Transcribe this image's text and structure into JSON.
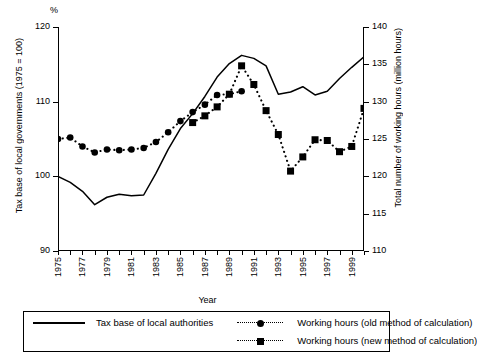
{
  "chart_data": {
    "type": "line",
    "title": "",
    "xlabel": "Year",
    "unit_mark": "%",
    "grid": false,
    "legend_position": "bottom",
    "x": [
      1975,
      1976,
      1977,
      1978,
      1979,
      1980,
      1981,
      1982,
      1983,
      1984,
      1985,
      1986,
      1987,
      1988,
      1989,
      1990,
      1991,
      1992,
      1993,
      1994,
      1995,
      1996,
      1997,
      1998,
      1999,
      2000
    ],
    "xlim": [
      1975,
      2000
    ],
    "xticks": [
      1975,
      1977,
      1979,
      1981,
      1983,
      1985,
      1987,
      1989,
      1991,
      1993,
      1995,
      1997,
      1999
    ],
    "xticklabels": [
      "1975",
      "1977",
      "1979",
      "1981",
      "1983",
      "1985",
      "1987",
      "1989",
      "1991",
      "1993",
      "1995",
      "1997",
      "1999"
    ],
    "axes": [
      {
        "side": "left",
        "label": "Tax base of local governments (1975 = 100)",
        "lim": [
          90,
          120
        ],
        "ticks": [
          90,
          100,
          110,
          120
        ],
        "ticklabels": [
          "90",
          "100",
          "110",
          "120"
        ]
      },
      {
        "side": "right",
        "label": "Total number of working hours (million hours)",
        "lim": [
          110,
          140
        ],
        "ticks": [
          110,
          115,
          120,
          125,
          130,
          135,
          140
        ],
        "ticklabels": [
          "110",
          "115",
          "120",
          "125",
          "130",
          "135",
          "140"
        ]
      }
    ],
    "series": [
      {
        "name": "Tax base of local authorities",
        "axis": "left",
        "style": "solid",
        "marker": "none",
        "x": [
          1975,
          1976,
          1977,
          1978,
          1979,
          1980,
          1981,
          1982,
          1983,
          1984,
          1985,
          1986,
          1987,
          1988,
          1989,
          1990,
          1991,
          1992,
          1993,
          1994,
          1995,
          1996,
          1997,
          1998,
          1999,
          2000
        ],
        "values": [
          100.0,
          99.2,
          98.0,
          96.2,
          97.2,
          97.6,
          97.4,
          97.5,
          100.4,
          103.6,
          106.4,
          108.4,
          110.7,
          113.3,
          115.1,
          116.2,
          115.8,
          114.8,
          111.0,
          111.3,
          112.0,
          110.9,
          111.4,
          113.1,
          114.6,
          116.0
        ]
      },
      {
        "name": "Working hours (old method of calculation)",
        "axis": "right",
        "style": "dotted",
        "marker": "circle",
        "x": [
          1975,
          1976,
          1977,
          1978,
          1979,
          1980,
          1981,
          1982,
          1983,
          1984,
          1985,
          1986,
          1987,
          1988,
          1989,
          1990
        ],
        "values": [
          125.0,
          125.2,
          124.0,
          123.2,
          123.6,
          123.5,
          123.6,
          123.8,
          124.6,
          125.9,
          127.4,
          128.6,
          129.6,
          130.9,
          131.0,
          131.4
        ]
      },
      {
        "name": "Working hours (new method of calculation)",
        "axis": "right",
        "style": "dotted",
        "marker": "square",
        "x": [
          1986,
          1987,
          1988,
          1989,
          1990,
          1991,
          1992,
          1993,
          1994,
          1995,
          1996,
          1997,
          1998,
          1999,
          2000
        ],
        "values": [
          127.2,
          128.1,
          129.3,
          131.0,
          134.8,
          132.3,
          128.8,
          125.6,
          120.7,
          122.6,
          124.9,
          124.8,
          123.3,
          124.0,
          129.1
        ]
      }
    ]
  },
  "legend": {
    "entries": [
      {
        "label": "Tax base of local authorities",
        "style": "solid",
        "marker": "none"
      },
      {
        "label": "Working hours (old method of calculation)",
        "style": "dotted",
        "marker": "circle"
      },
      {
        "label": "Working hours (new method of calculation)",
        "style": "dotted",
        "marker": "square"
      }
    ]
  }
}
